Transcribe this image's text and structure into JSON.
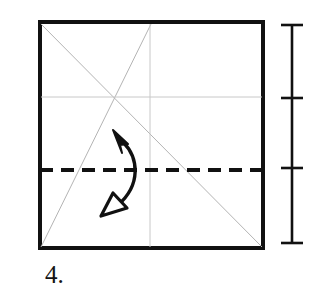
{
  "figure": {
    "kind": "origami-fold-diagram",
    "step_label": "4.",
    "background_color": "#ffffff",
    "ink_color": "#111111",
    "crease_color": "#b4b4b4"
  },
  "paper": {
    "name": "square-sheet",
    "shape": "square",
    "left": 40,
    "top": 22,
    "right": 263,
    "bottom": 248,
    "width": 223,
    "height": 226,
    "outline_color": "#111111",
    "outline_width": 4,
    "fill_color": "#ffffff"
  },
  "creases": [
    {
      "name": "crease-diagonal-main",
      "style": "existing-crease",
      "color": "#b4b4b4",
      "width": 1,
      "x1": 41,
      "y1": 24,
      "x2": 262,
      "y2": 247
    },
    {
      "name": "crease-diagonal-partial",
      "style": "existing-crease",
      "color": "#b4b4b4",
      "width": 1,
      "x1": 41,
      "y1": 247,
      "x2": 151,
      "y2": 24
    },
    {
      "name": "crease-horizontal-quarter",
      "style": "existing-crease",
      "color": "#c8c8c8",
      "width": 1,
      "x1": 41,
      "y1": 97,
      "x2": 262,
      "y2": 97
    },
    {
      "name": "crease-vertical-center",
      "style": "existing-crease",
      "color": "#c8c8c8",
      "width": 1,
      "x1": 150,
      "y1": 24,
      "x2": 150,
      "y2": 247
    }
  ],
  "fold_line": {
    "name": "valley-fold-dashed-line",
    "style": "dashed",
    "meaning": "valley fold",
    "color": "#111111",
    "width": 4,
    "dash_pattern": "13 8",
    "x1": 40,
    "y1": 170,
    "x2": 263,
    "y2": 170
  },
  "fold_arrow": {
    "name": "fold-and-unfold-arrow",
    "meaning": "fold then unfold",
    "color": "#111111",
    "stroke_width": 3.4,
    "path": "M 123 142 C 139 158, 141 185, 118 205",
    "head_solid": {
      "name": "solid-arrowhead-up",
      "direction": "up-left",
      "fill": "#111111",
      "points": "113,130 128,144 120,145 122,153"
    },
    "head_hollow": {
      "name": "hollow-arrowhead-down",
      "direction": "down-left",
      "fill": "#ffffff",
      "stroke": "#111111",
      "points": "101,216 113,193 127,208"
    }
  },
  "dimension": {
    "name": "height-dimension-line",
    "color": "#111111",
    "axis_x": 292,
    "axis_top": 25,
    "axis_bottom": 243,
    "line_width": 2.6,
    "tick_half_length": 11,
    "tick_width": 2.6,
    "ticks": [
      {
        "name": "dimension-tick-top",
        "y": 25
      },
      {
        "name": "dimension-tick-upper",
        "y": 98
      },
      {
        "name": "dimension-tick-middle",
        "y": 168
      },
      {
        "name": "dimension-tick-bottom",
        "y": 243
      }
    ]
  },
  "caption": {
    "name": "step-number-caption",
    "text": "4.",
    "x": 45,
    "y": 283,
    "font_size": 25,
    "color": "#141414"
  }
}
